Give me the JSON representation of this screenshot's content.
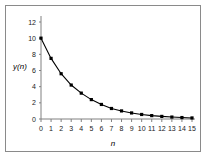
{
  "chart_data": {
    "type": "line",
    "title": "",
    "subtitle": "",
    "xlabel": "n",
    "ylabel": "y(n)",
    "xlim": [
      0,
      15
    ],
    "ylim": [
      0,
      12
    ],
    "grid": false,
    "legend": null,
    "x": [
      0,
      1,
      2,
      3,
      4,
      5,
      6,
      7,
      8,
      9,
      10,
      11,
      12,
      13,
      14,
      15
    ],
    "categories": [
      "0",
      "1",
      "2",
      "3",
      "4",
      "5",
      "6",
      "7",
      "8",
      "9",
      "10",
      "11",
      "12",
      "13",
      "14",
      "15"
    ],
    "values": [
      10,
      7.5,
      5.6,
      4.2,
      3.2,
      2.4,
      1.8,
      1.3,
      1.0,
      0.75,
      0.56,
      0.42,
      0.32,
      0.24,
      0.18,
      0.13
    ],
    "series": [
      {
        "name": "y(n)",
        "values": [
          10,
          7.5,
          5.6,
          4.2,
          3.2,
          2.4,
          1.8,
          1.3,
          1.0,
          0.75,
          0.56,
          0.42,
          0.32,
          0.24,
          0.18,
          0.13
        ],
        "color": "#000000",
        "marker": "square",
        "line_style": "solid"
      }
    ],
    "xticks": [
      0,
      1,
      2,
      3,
      4,
      5,
      6,
      7,
      8,
      9,
      10,
      11,
      12,
      13,
      14,
      15
    ],
    "xtick_labels": [
      "0",
      "1",
      "2",
      "3",
      "4",
      "5",
      "6",
      "7",
      "8",
      "9",
      "10",
      "11",
      "12",
      "13",
      "14",
      "15"
    ],
    "yticks": [
      0,
      2,
      4,
      6,
      8,
      10,
      12
    ],
    "ytick_labels": [
      "0",
      "2",
      "4",
      "6",
      "8",
      "10",
      "12"
    ]
  },
  "figure": {
    "background_color": "#ffffff",
    "frame_color": "#8a8a8a",
    "axis_color": "#808080",
    "data_color": "#000000"
  }
}
